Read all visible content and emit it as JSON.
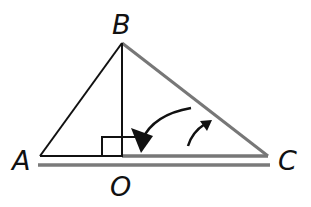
{
  "diagram": {
    "type": "geometry-triangle",
    "points": {
      "A": {
        "label": "A",
        "x": 40,
        "y": 156
      },
      "B": {
        "label": "B",
        "x": 122,
        "y": 43
      },
      "C": {
        "label": "C",
        "x": 268,
        "y": 156
      },
      "O": {
        "label": "O",
        "x": 122,
        "y": 156
      }
    },
    "segments": [
      {
        "from": "A",
        "to": "B",
        "color": "#111111"
      },
      {
        "from": "B",
        "to": "O",
        "color": "#111111"
      },
      {
        "from": "A",
        "to": "O",
        "color": "#111111"
      },
      {
        "from": "B",
        "to": "C",
        "color": "#777777"
      },
      {
        "from": "O",
        "to": "C",
        "color": "#777777"
      }
    ],
    "annotations": {
      "right_angle_at": "O",
      "rotation_arrows": 2,
      "parallel_line_below_AC": true
    },
    "colors": {
      "black": "#111111",
      "gray": "#777777"
    }
  }
}
